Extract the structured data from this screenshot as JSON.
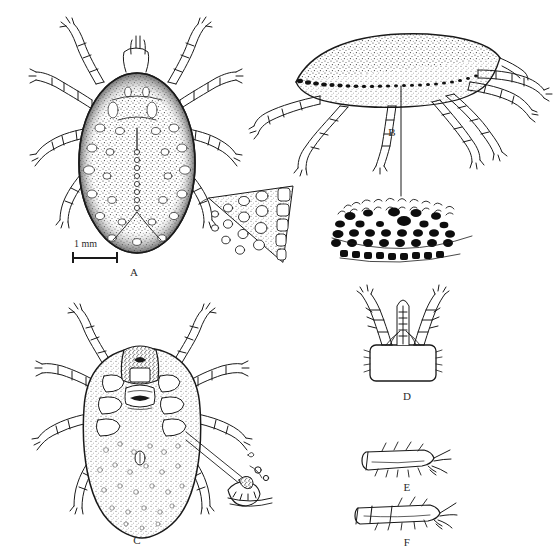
{
  "figure": {
    "kind": "scientific-illustration-plate",
    "background_color": "#ffffff",
    "ink_color": "#1a1a1a",
    "width": 553,
    "height": 559
  },
  "scale_bar": {
    "label": "1 mm",
    "x": 72,
    "y": 252,
    "length_px": 46,
    "belongs_to_panel": "A"
  },
  "panels": [
    {
      "id": "A",
      "label": "A",
      "label_x": 124,
      "label_y": 266,
      "view": "dorsal-whole-body",
      "description": "dorsal view of engorged female tick with punctate scutum and eight segmented legs",
      "center_x": 136,
      "center_y": 160
    },
    {
      "id": "A-inset",
      "label": "",
      "view": "marginal-punctation-detail",
      "description": "triangular magnified wedge of body margin showing pale ovoid punctations",
      "center_x": 250,
      "center_y": 220
    },
    {
      "id": "B",
      "label": "B",
      "label_x": 382,
      "label_y": 126,
      "view": "lateral-whole-body",
      "description": "lateral view of tick body with stippled idiosoma and legs, leader line to festoon detail",
      "center_x": 400,
      "center_y": 95
    },
    {
      "id": "B-inset",
      "label": "",
      "view": "festoon-punctation-detail",
      "description": "magnified marginal band with dense black punctations and setae",
      "center_x": 400,
      "center_y": 225
    },
    {
      "id": "C",
      "label": "C",
      "label_x": 127,
      "label_y": 534,
      "view": "ventral-whole-body",
      "description": "ventral view showing capitulum, genital aperture, anal groove and coxae",
      "center_x": 140,
      "center_y": 420
    },
    {
      "id": "C-inset",
      "label": "",
      "view": "coxal-spur-detail",
      "description": "magnified coxa with spur and pore detail, connected by two leader lines",
      "center_x": 255,
      "center_y": 487
    },
    {
      "id": "D",
      "label": "D",
      "label_x": 397,
      "label_y": 390,
      "view": "capitulum-ventral",
      "description": "ventral capitulum with palps, hypostome and basis capituli",
      "center_x": 403,
      "center_y": 335
    },
    {
      "id": "E",
      "label": "E",
      "label_x": 397,
      "label_y": 481,
      "view": "tarsus-segment",
      "description": "leg tarsus segment with setae, lateral aspect",
      "center_x": 403,
      "center_y": 457
    },
    {
      "id": "F",
      "label": "F",
      "label_x": 397,
      "label_y": 536,
      "view": "tarsus-segment",
      "description": "second leg tarsus segment with setae, lateral aspect",
      "center_x": 403,
      "center_y": 512
    }
  ]
}
